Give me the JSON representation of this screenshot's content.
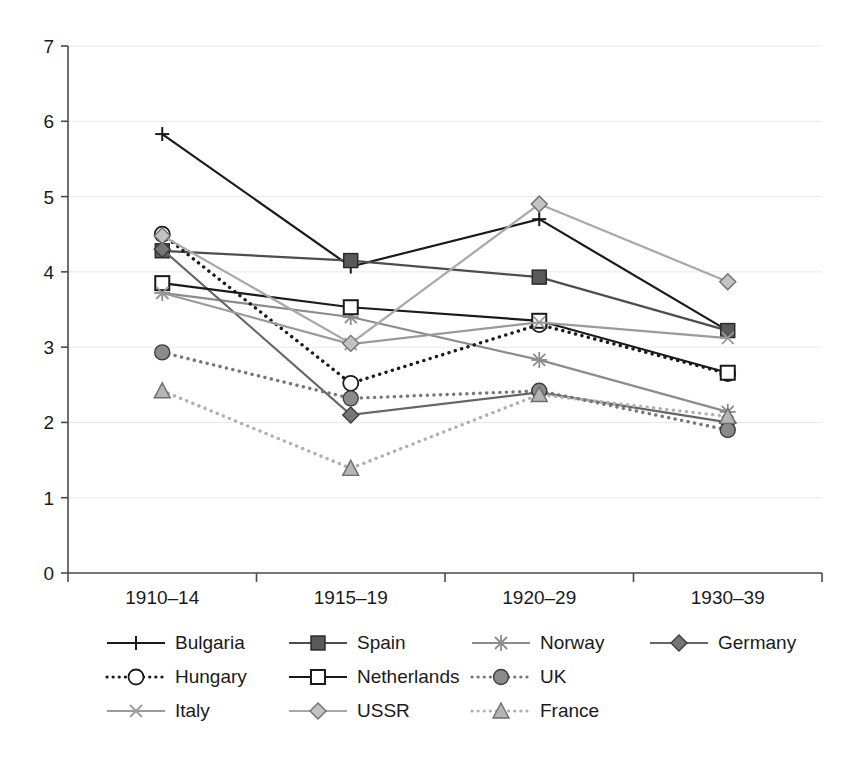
{
  "chart_data": {
    "type": "line",
    "title": "",
    "xlabel": "",
    "ylabel": "",
    "categories": [
      "1910–14",
      "1915–19",
      "1920–29",
      "1930–39"
    ],
    "ylim": [
      0,
      7
    ],
    "yticks": [
      "0",
      "1",
      "2",
      "3",
      "4",
      "5",
      "6",
      "7"
    ],
    "grid": true,
    "legend_position": "bottom",
    "series": [
      {
        "name": "Bulgaria",
        "marker": "plus",
        "line": "solid",
        "color": "#1a1a1a",
        "values": [
          5.83,
          4.07,
          4.7,
          3.22
        ]
      },
      {
        "name": "Spain",
        "marker": "square-filled",
        "line": "solid",
        "color": "#4d4d4d",
        "values": [
          4.28,
          4.15,
          3.93,
          3.22
        ]
      },
      {
        "name": "Norway",
        "marker": "asterisk",
        "line": "solid",
        "color": "#8c8c8c",
        "values": [
          3.72,
          3.4,
          2.83,
          2.14
        ]
      },
      {
        "name": "Germany",
        "marker": "diamond-filled",
        "line": "solid",
        "color": "#666666",
        "values": [
          4.3,
          2.1,
          2.4,
          2.0
        ]
      },
      {
        "name": "Hungary",
        "marker": "circle-open",
        "line": "dotted",
        "color": "#1a1a1a",
        "values": [
          4.5,
          2.52,
          3.3,
          2.65
        ]
      },
      {
        "name": "Netherlands",
        "marker": "square-open",
        "line": "solid",
        "color": "#1a1a1a",
        "values": [
          3.85,
          3.53,
          3.35,
          2.66
        ]
      },
      {
        "name": "UK",
        "marker": "circle-filled",
        "line": "dotted",
        "color": "#767676",
        "values": [
          2.93,
          2.32,
          2.42,
          1.9
        ]
      },
      {
        "name": "Italy",
        "marker": "cross",
        "line": "solid",
        "color": "#9a9a9a",
        "values": [
          3.72,
          3.04,
          3.33,
          3.12
        ]
      },
      {
        "name": "USSR",
        "marker": "diamond-light",
        "line": "solid",
        "color": "#a8a8a8",
        "values": [
          4.48,
          3.05,
          4.9,
          3.87
        ]
      },
      {
        "name": "France",
        "marker": "triangle",
        "line": "dotted",
        "color": "#b0b0b0",
        "values": [
          2.42,
          1.39,
          2.37,
          2.08
        ]
      }
    ]
  },
  "legend": {
    "rows": [
      [
        {
          "name": "Bulgaria",
          "marker": "plus",
          "line": "solid",
          "color": "#1a1a1a"
        },
        {
          "name": "Spain",
          "marker": "square-filled",
          "line": "solid",
          "color": "#4d4d4d"
        },
        {
          "name": "Norway",
          "marker": "asterisk",
          "line": "solid",
          "color": "#8c8c8c"
        },
        {
          "name": "Germany",
          "marker": "diamond-filled",
          "line": "solid",
          "color": "#666666"
        }
      ],
      [
        {
          "name": "Hungary",
          "marker": "circle-open",
          "line": "dotted",
          "color": "#1a1a1a"
        },
        {
          "name": "Netherlands",
          "marker": "square-open",
          "line": "solid",
          "color": "#1a1a1a"
        },
        {
          "name": "UK",
          "marker": "circle-filled",
          "line": "dotted",
          "color": "#767676"
        }
      ],
      [
        {
          "name": "Italy",
          "marker": "cross",
          "line": "solid",
          "color": "#9a9a9a"
        },
        {
          "name": "USSR",
          "marker": "diamond-light",
          "line": "solid",
          "color": "#a8a8a8"
        },
        {
          "name": "France",
          "marker": "triangle",
          "line": "dotted",
          "color": "#b0b0b0"
        }
      ]
    ]
  },
  "colors": {
    "axis": "#4a4a4a",
    "grid": "#e8e8e8",
    "background": "#ffffff",
    "text": "#1a1a1a"
  }
}
